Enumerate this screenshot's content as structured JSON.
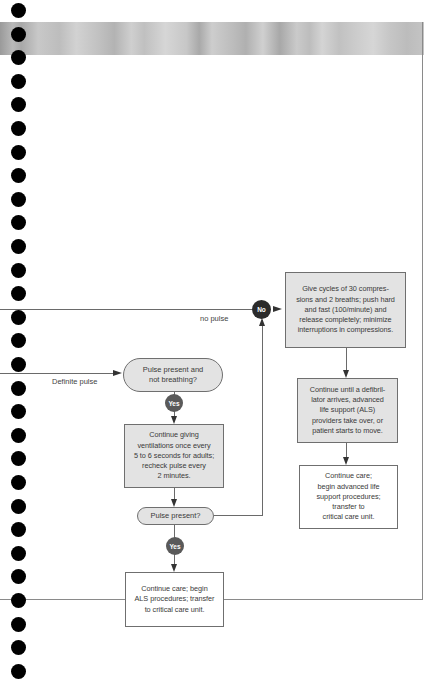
{
  "diagram": {
    "colors": {
      "box_fill": "#e3e3e3",
      "box_border": "#6f6f6f",
      "no_badge": "#2b2b2b",
      "yes_badge": "#5a5a5a",
      "line": "#6a6a6a",
      "binder_hole": "#000000"
    },
    "labels": {
      "no_pulse": "no pulse",
      "definite_pulse": "Definite pulse"
    },
    "badges": {
      "no": "No",
      "yes_1": "Yes",
      "yes_2": "Yes"
    },
    "nodes": {
      "cpr_cycles": "Give cycles of 30 compressions and 2 breaths; push hard and fast (100/minute) and release completely; minimize interruptions in compressions.",
      "continue_until": "Continue until a defibrillator arrives, advanced life support (ALS) providers take over, or patient starts to move.",
      "continue_care_right": "Continue care; begin advanced life support procedures; transfer to critical care unit.",
      "pulse_not_breathing": "Pulse present and not breathing?",
      "continue_ventilations": "Continue giving ventilations once every 5 to 6 seconds for adults; recheck pulse every 2 minutes.",
      "pulse_present": "Pulse present?",
      "continue_care_left": "Continue care; begin ALS procedures; transfer to critical care unit."
    },
    "node_lines": {
      "cpr_cycles": [
        "Give cycles of 30 compres-",
        "sions and 2 breaths; push hard",
        "and fast (100/minute) and",
        "release completely; minimize",
        "interruptions in compressions."
      ],
      "continue_until": [
        "Continue until a defibril-",
        "lator arrives, advanced",
        "life support (ALS)",
        "providers take over, or",
        "patient starts to move."
      ],
      "continue_care_right": [
        "Continue care;",
        "begin advanced life",
        "support procedures;",
        "transfer to",
        "critical care unit."
      ],
      "pulse_not_breathing": [
        "Pulse present and",
        "not breathing?"
      ],
      "continue_ventilations": [
        "Continue giving",
        "ventilations once every",
        "5 to 6 seconds for adults;",
        "recheck pulse every",
        "2 minutes."
      ],
      "continue_care_left": [
        "Continue care; begin",
        "ALS procedures; transfer",
        "to critical care unit."
      ]
    }
  }
}
